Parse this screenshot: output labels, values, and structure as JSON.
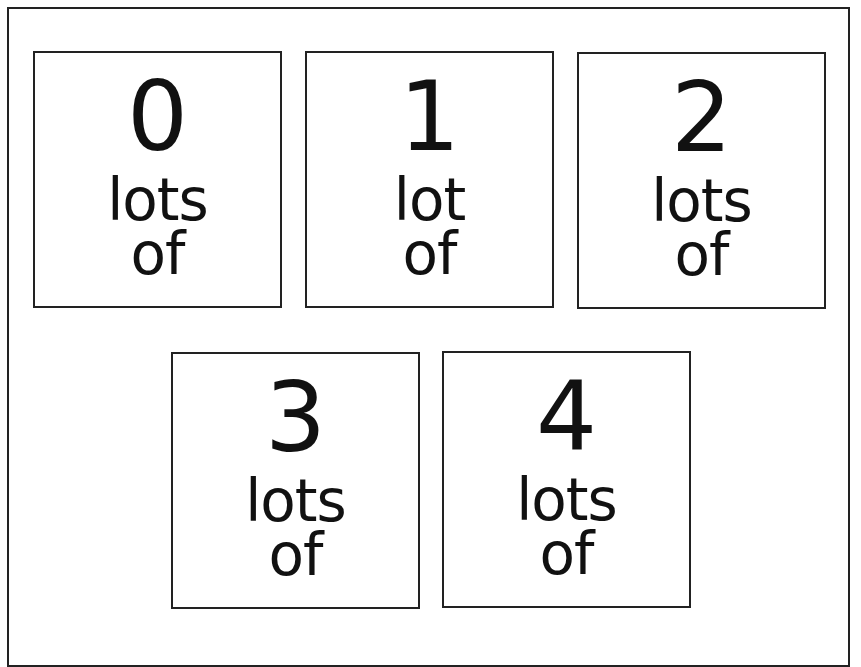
{
  "page": {
    "cutoff_heading": "",
    "cards": [
      {
        "numeral": "0",
        "line1": "lots",
        "line2": "of"
      },
      {
        "numeral": "1",
        "line1": "lot",
        "line2": "of"
      },
      {
        "numeral": "2",
        "line1": "lots",
        "line2": "of"
      },
      {
        "numeral": "3",
        "line1": "lots",
        "line2": "of"
      },
      {
        "numeral": "4",
        "line1": "lots",
        "line2": "of"
      }
    ]
  }
}
